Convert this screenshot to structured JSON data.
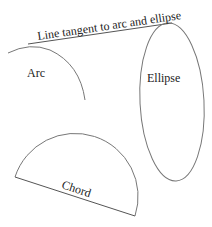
{
  "diagram": {
    "labels": {
      "tangent": "Line tangent to arc and ellipse",
      "arc": "Arc",
      "ellipse": "Ellipse",
      "chord": "Chord"
    },
    "colors": {
      "stroke": "#777777",
      "text": "#222222",
      "background": "#ffffff"
    }
  }
}
